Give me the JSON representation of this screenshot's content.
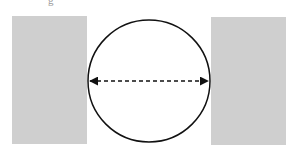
{
  "diagram": {
    "top_fragment_text": "g",
    "left_block": {
      "x": 12,
      "y": 16,
      "w": 75,
      "h": 128,
      "color": "#cfcfcf"
    },
    "right_block": {
      "x": 211,
      "y": 17,
      "w": 75,
      "h": 128,
      "color": "#cfcfcf"
    },
    "circle": {
      "cx": 149,
      "cy": 81,
      "r": 61,
      "stroke": "#111111"
    },
    "diameter_arrow": {
      "x1": 89,
      "x2": 209,
      "y": 81,
      "style": "dashed",
      "heads": "both"
    }
  }
}
